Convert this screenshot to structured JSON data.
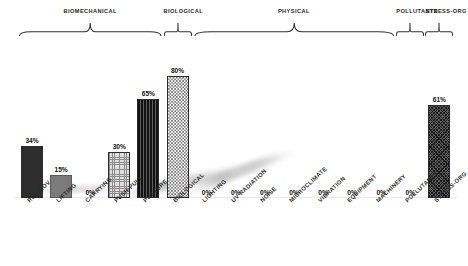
{
  "chart_data": {
    "type": "bar",
    "title": "",
    "subtitle": "",
    "xlabel": "",
    "ylabel": "",
    "ylim": [
      0,
      100
    ],
    "grid": false,
    "legend": "none",
    "value_suffix": "%",
    "categories": [
      "REP MOV",
      "LIFTING",
      "CARRYING",
      "PUSH-PULL",
      "POSTURE",
      "BIOLOGICAL",
      "LIGHTING",
      "UV RADIATION",
      "NOISE",
      "MICROCLIMATE",
      "VIBRATION",
      "EQUIPMENT",
      "MACHINERY",
      "POLLUTANTS",
      "STRESS-ORG"
    ],
    "values": [
      34,
      15,
      0,
      30,
      65,
      80,
      0,
      0,
      0,
      0,
      0,
      0,
      0,
      0,
      61
    ],
    "value_labels": [
      "34%",
      "15%",
      "0%",
      "30%",
      "65%",
      "80%",
      "0%",
      "0%",
      "0%",
      "0%",
      "0%",
      "0%",
      "0%",
      "0%",
      "61%"
    ],
    "bar_fills": [
      "solid-dark",
      "solid-mid",
      "none",
      "grid-light",
      "vline-dark",
      "checker",
      "none",
      "none",
      "none",
      "none",
      "none",
      "none",
      "none",
      "none",
      "diag-cross"
    ],
    "groups": [
      {
        "label": "BIOMECHANICAL",
        "start_index": 0,
        "end_index": 4
      },
      {
        "label": "BIOLOGICAL",
        "start_index": 5,
        "end_index": 5
      },
      {
        "label": "PHYSICAL",
        "start_index": 6,
        "end_index": 12
      },
      {
        "label": "POLLUTANTS",
        "start_index": 13,
        "end_index": 13
      },
      {
        "label": "STRESS-ORG",
        "start_index": 14,
        "end_index": 14
      }
    ]
  },
  "colors": {
    "background": "#ffffff",
    "bar_dark": "#2d2d2d",
    "bar_mid": "#7b7b7b",
    "bar_outline": "#2b2b2b",
    "text": "#1a1a1a",
    "bracket": "#303030"
  }
}
